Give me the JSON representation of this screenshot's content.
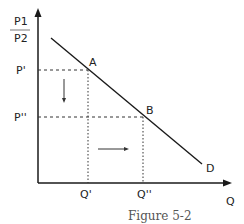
{
  "figure": {
    "caption": "Figure 5-2",
    "y_axis_label_top": "P1",
    "y_axis_label_bottom": "P2",
    "x_axis_label": "Q",
    "price_labels": [
      "P'",
      "P''"
    ],
    "quantity_labels": [
      "Q'",
      "Q''"
    ],
    "points": [
      "A",
      "B"
    ],
    "curve_label": "D"
  },
  "colors": {
    "line": "#1a1a1a",
    "dashed": "#333333",
    "text": "#222222",
    "caption": "#555555"
  }
}
